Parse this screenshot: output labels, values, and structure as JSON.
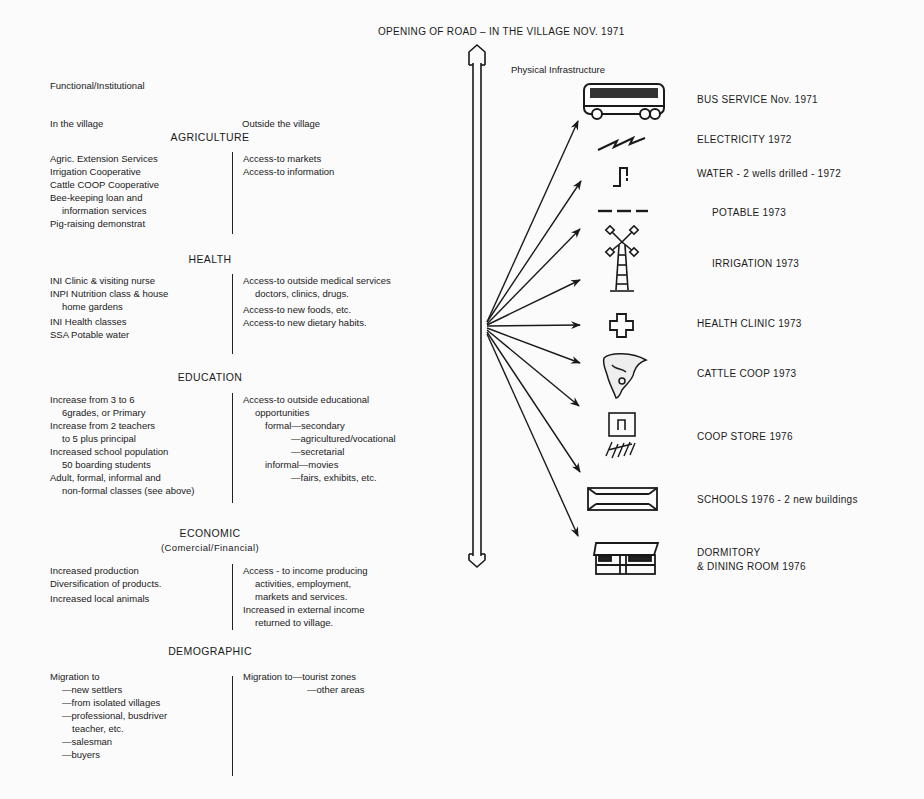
{
  "title": "OPENING OF ROAD – IN THE VILLAGE NOV. 1971",
  "left_panel": {
    "heading": "Functional/Institutional",
    "col_in": "In the village",
    "col_out": "Outside the village",
    "sections": [
      {
        "name": "AGRICULTURE",
        "subtitle": "",
        "in_village": [
          "Agric. Extension Services",
          "Irrigation Cooperative",
          "Cattle COOP Cooperative",
          "Bee-keeping loan and",
          "information services",
          "Pig-raising demonstrat"
        ],
        "outside_village": [
          "Access-to markets",
          "Access-to information"
        ]
      },
      {
        "name": "HEALTH",
        "subtitle": "",
        "in_village": [
          "INI Clinic & visiting nurse",
          "INPI Nutrition class & house",
          "home gardens",
          "INI Health classes",
          "SSA Potable water"
        ],
        "outside_village": [
          "Access-to outside medical services",
          "doctors, clinics, drugs.",
          "Access-to new foods, etc.",
          "Access-to new dietary habits."
        ]
      },
      {
        "name": "EDUCATION",
        "subtitle": "",
        "in_village": [
          "Increase from 3 to 6",
          "6grades, or Primary",
          "Increase from 2 teachers",
          "to 5 plus principal",
          "Increased school population",
          "50 boarding students",
          "Adult, formal, informal and",
          "non-formal classes (see above)"
        ],
        "outside_village": [
          "Access-to outside educational",
          "opportunities",
          "formal—secondary",
          "—agricultured/vocational",
          "—secretarial",
          "informal—movies",
          "—fairs, exhibits, etc."
        ]
      },
      {
        "name": "ECONOMIC",
        "subtitle": "(Comercial/Financial)",
        "in_village": [
          "Increased production",
          "Diversification of products.",
          "Increased local animals"
        ],
        "outside_village": [
          "Access - to income producing",
          "activities, employment,",
          "markets and services.",
          "Increased in external income",
          "returned to village."
        ]
      },
      {
        "name": "DEMOGRAPHIC",
        "subtitle": "",
        "in_village": [
          "Migration to",
          "—new settlers",
          "—from isolated villages",
          "—professional, busdriver",
          "teacher, etc.",
          "—salesman",
          "—buyers"
        ],
        "outside_village": [
          "Migration to—tourist zones",
          "—other areas"
        ]
      }
    ]
  },
  "right_panel": {
    "heading": "Physical Infrastructure",
    "items": [
      {
        "icon": "bus-icon",
        "label": "BUS SERVICE Nov. 1971"
      },
      {
        "icon": "electricity-icon",
        "label": "ELECTRICITY 1972"
      },
      {
        "icon": "water-tap-icon",
        "label": "WATER - 2 wells drilled - 1972"
      },
      {
        "icon": "potable-water-icon",
        "label": "POTABLE 1973"
      },
      {
        "icon": "windmill-icon",
        "label": "IRRIGATION 1973"
      },
      {
        "icon": "health-cross-icon",
        "label": "HEALTH CLINIC 1973"
      },
      {
        "icon": "cattle-icon",
        "label": "CATTLE COOP 1973"
      },
      {
        "icon": "store-icon",
        "label": "COOP STORE 1976"
      },
      {
        "icon": "school-building-icon",
        "label": "SCHOOLS 1976 - 2 new buildings"
      },
      {
        "icon": "dormitory-icon",
        "label": "DORMITORY"
      },
      {
        "icon": "",
        "label": "& DINING ROOM 1976"
      }
    ]
  }
}
